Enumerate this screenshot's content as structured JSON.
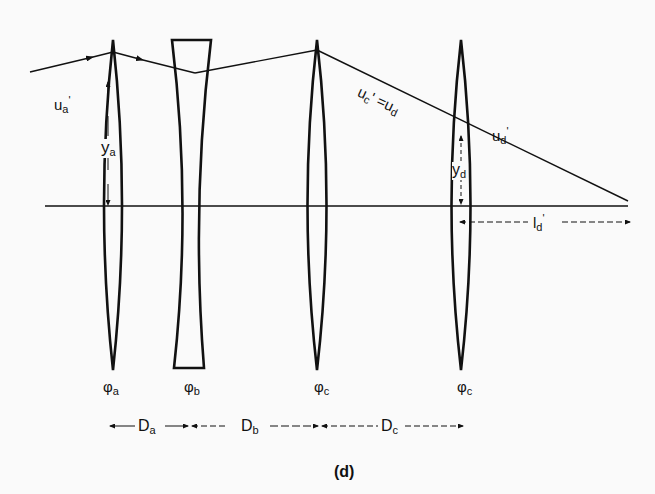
{
  "figure": {
    "caption": "(d)",
    "type": "thin-lens system ray trace",
    "lenses": [
      {
        "id": "a",
        "kind": "converging",
        "power_label": "φa",
        "power_symbol": "φ",
        "power_sub": "a"
      },
      {
        "id": "b",
        "kind": "diverging",
        "power_label": "φb",
        "power_symbol": "φ",
        "power_sub": "b"
      },
      {
        "id": "c",
        "kind": "converging",
        "power_label": "φc",
        "power_symbol": "φ",
        "power_sub": "c"
      },
      {
        "id": "d",
        "kind": "converging",
        "power_label": "φc",
        "power_symbol": "φ",
        "power_sub": "c"
      }
    ],
    "ray_labels": {
      "ua": {
        "base": "u",
        "sub": "a",
        "suffix": "'"
      },
      "uc_eq_ud": {
        "base": "u",
        "sub": "c",
        "mid": "' =u",
        "sub2": "d"
      },
      "ud_prime": {
        "base": "u",
        "sub": "d",
        "suffix": "'"
      }
    },
    "heights": {
      "ya": {
        "base": "y",
        "sub": "a"
      },
      "yd": {
        "base": "y",
        "sub": "d"
      }
    },
    "back_focal": {
      "base": "l",
      "sub": "d",
      "suffix": "'"
    },
    "spacings": [
      {
        "base": "D",
        "sub": "a"
      },
      {
        "base": "D",
        "sub": "b"
      },
      {
        "base": "D",
        "sub": "c"
      }
    ],
    "colors": {
      "ink": "#111111",
      "background": "#fafafa"
    }
  }
}
